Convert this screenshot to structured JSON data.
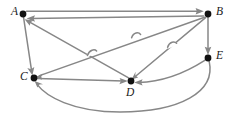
{
  "figure": {
    "width": 236,
    "height": 117,
    "background_color": "#ffffff",
    "edge_color": "#878787",
    "node_color": "#111111",
    "label_color": "#1a1a1a"
  },
  "nodes": [
    {
      "id": "A",
      "label": "A",
      "x": 23,
      "y": 14,
      "label_x": 11,
      "label_y": 6,
      "radius": 3.2
    },
    {
      "id": "B",
      "label": "B",
      "x": 208,
      "y": 14,
      "label_x": 216,
      "label_y": 6,
      "radius": 3.2
    },
    {
      "id": "C",
      "label": "C",
      "x": 34,
      "y": 78,
      "label_x": 20,
      "label_y": 71,
      "radius": 3.2
    },
    {
      "id": "D",
      "label": "D",
      "x": 131,
      "y": 81,
      "label_x": 126,
      "label_y": 87,
      "radius": 3.2
    },
    {
      "id": "E",
      "label": "E",
      "x": 208,
      "y": 58,
      "label_x": 216,
      "label_y": 50,
      "radius": 3.2
    }
  ],
  "edges": [
    {
      "id": "A-B",
      "from": "A",
      "to": "B",
      "directed": true,
      "shape": "line",
      "label": "A to B"
    },
    {
      "id": "B-A",
      "from": "B",
      "to": "A",
      "directed": true,
      "shape": "line",
      "label": "B to A"
    },
    {
      "id": "A-C",
      "from": "A",
      "to": "C",
      "directed": true,
      "shape": "line",
      "label": "A to C"
    },
    {
      "id": "B-E",
      "from": "B",
      "to": "E",
      "directed": true,
      "shape": "line",
      "label": "B to E"
    },
    {
      "id": "B-C",
      "from": "B",
      "to": "C",
      "directed": true,
      "shape": "line",
      "label": "B to C"
    },
    {
      "id": "B-D",
      "from": "B",
      "to": "D",
      "directed": true,
      "shape": "line",
      "label": "B to D"
    },
    {
      "id": "C-D",
      "from": "C",
      "to": "D",
      "directed": true,
      "shape": "line",
      "label": "C to D"
    },
    {
      "id": "D-A",
      "from": "D",
      "to": "A",
      "directed": true,
      "shape": "line",
      "label": "D to A"
    },
    {
      "id": "E-D",
      "from": "E",
      "to": "D",
      "directed": true,
      "shape": "curve",
      "label": "E to D"
    },
    {
      "id": "E-C",
      "from": "E",
      "to": "C",
      "directed": true,
      "shape": "curve",
      "label": "E to C"
    }
  ],
  "crossings": [
    {
      "id": "hop-1",
      "x": 92,
      "y": 53
    },
    {
      "id": "hop-2",
      "x": 136,
      "y": 36
    },
    {
      "id": "hop-3",
      "x": 172,
      "y": 45
    }
  ]
}
